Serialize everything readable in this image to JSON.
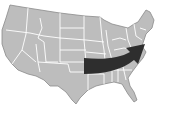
{
  "map": {
    "subject": "United States map",
    "land_color": "#bdbdbd",
    "border_color": "#ffffff",
    "outline_color": "#8a8a8a",
    "background": "#ffffff"
  },
  "arrow": {
    "description": "Arrow from central US curving toward the Northeast",
    "color": "#2e2e2e"
  }
}
